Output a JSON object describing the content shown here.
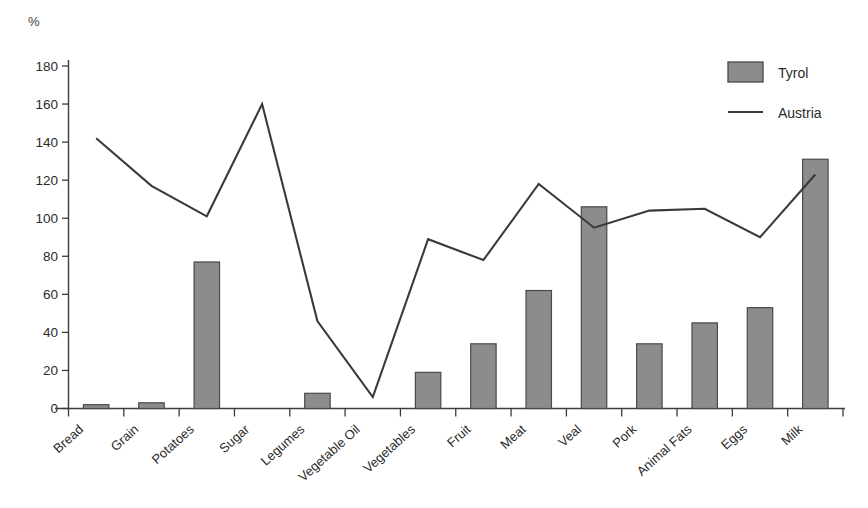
{
  "chart_data": {
    "type": "bar",
    "title": "",
    "subtitle": "",
    "xlabel": "",
    "ylabel": "%",
    "ylim": [
      0,
      180
    ],
    "yticks": [
      0,
      20,
      40,
      60,
      80,
      100,
      120,
      140,
      160,
      180
    ],
    "grid": false,
    "legend_position": "top-right",
    "categories": [
      "Bread",
      "Grain",
      "Potatoes",
      "Sugar",
      "Legumes",
      "Vegetable Oil",
      "Vegetables",
      "Fruit",
      "Meat",
      "Veal",
      "Pork",
      "Animal Fats",
      "Eggs",
      "Milk"
    ],
    "series": [
      {
        "name": "Tyrol",
        "type": "bar",
        "color": "#8c8c8c",
        "values": [
          2,
          3,
          77,
          0,
          8,
          0,
          19,
          34,
          62,
          106,
          34,
          45,
          53,
          131
        ]
      },
      {
        "name": "Austria",
        "type": "line",
        "color": "#3a3a3a",
        "values": [
          142,
          117,
          101,
          160,
          46,
          6,
          89,
          78,
          118,
          95,
          104,
          105,
          90,
          123
        ]
      }
    ]
  },
  "legend": {
    "items": [
      {
        "label": "Tyrol",
        "marker": "bar-swatch"
      },
      {
        "label": "Austria",
        "marker": "line-swatch"
      }
    ]
  },
  "axis": {
    "unit_label": "%"
  }
}
